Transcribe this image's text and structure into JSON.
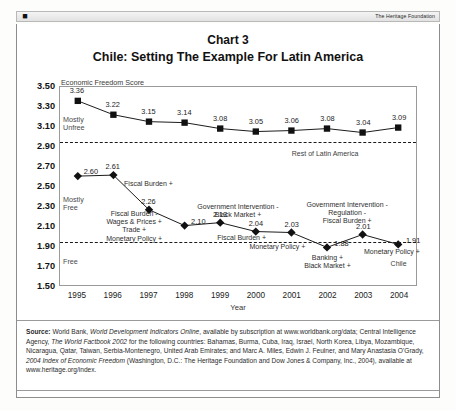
{
  "header": {
    "logo_icon": "heritage-mark-icon",
    "publisher": "The Heritage Foundation"
  },
  "titles": {
    "chart_label": "Chart 3",
    "chart_title": "Chile: Setting The Example For Latin America"
  },
  "chart_data": {
    "type": "line",
    "title": "Chile: Setting The Example For Latin America",
    "subtitle": "Chart 3",
    "axis_caption": "Economic Freedom Score",
    "xlabel": "Year",
    "ylabel": "Economic Freedom Score",
    "categories": [
      "1995",
      "1996",
      "1997",
      "1998",
      "1999",
      "2000",
      "2001",
      "2002",
      "2003",
      "2004"
    ],
    "ylim": [
      1.5,
      3.5
    ],
    "yticks": [
      "3.50",
      "3.30",
      "3.10",
      "2.90",
      "2.70",
      "2.50",
      "2.30",
      "2.10",
      "1.90",
      "1.70",
      "1.50"
    ],
    "grid": false,
    "legend": "none",
    "series": [
      {
        "name": "Rest of Latin America",
        "marker": "square",
        "values": [
          3.36,
          3.22,
          3.15,
          3.14,
          3.08,
          3.05,
          3.06,
          3.08,
          3.04,
          3.09
        ]
      },
      {
        "name": "Chile",
        "marker": "diamond",
        "values": [
          2.6,
          2.61,
          2.26,
          2.1,
          2.13,
          2.04,
          2.03,
          1.88,
          2.01,
          1.91
        ]
      }
    ],
    "reference_lines": [
      {
        "label": "Mostly Unfree / upper band",
        "value": 2.95
      },
      {
        "label": "Mostly Free / lower band",
        "value": 1.95
      }
    ],
    "zone_labels": [
      {
        "text": "Mostly\nUnfree",
        "value": 3.14
      },
      {
        "text": "Mostly\nFree",
        "value": 2.34
      },
      {
        "text": "Free",
        "value": 1.72
      }
    ],
    "series_labels": [
      {
        "text": "Rest of Latin America",
        "x": 2002,
        "value": 2.86
      },
      {
        "text": "Chile",
        "x": 2004,
        "value": 1.76
      }
    ],
    "annotations": [
      {
        "text": "Fiscal Burden +",
        "x": 1997,
        "value": 2.56
      },
      {
        "text": "Fiscal Burden -\nWages & Prices +\nTrade +\nMonetary Policy +",
        "x": 1996.6,
        "value": 2.26
      },
      {
        "text": "Government Intervention -\nBlack Market +",
        "x": 1999.5,
        "value": 2.33
      },
      {
        "text": "Fiscal Burden +",
        "x": 1999.6,
        "value": 2.02
      },
      {
        "text": "Monetary Policy +",
        "x": 2000.6,
        "value": 1.93
      },
      {
        "text": "Banking +\nBlack Market +",
        "x": 2002,
        "value": 1.82
      },
      {
        "text": "Government Intervention -\nRegulation -\nFiscal Burden +",
        "x": 2002.55,
        "value": 2.35
      },
      {
        "text": "Monetary Policy +",
        "x": 2003.8,
        "value": 1.88
      }
    ]
  },
  "source": {
    "label": "Source:",
    "line1_a": " World Bank, ",
    "line1_i": "World Development Indicators Online",
    "line1_b": ", available by subscription at www.worldbank.org/data; Central Intelligence Agency, ",
    "line2_i": "The World Factbook 2002",
    "line2_b": " for the following countries: Bahamas, Burma, Cuba, Iraq, Israel, North Korea, Libya, Mozambique, Nicaragua, Qatar, Taiwan, Serbia-Montenegro, United Arab Emirates; and Marc A. Miles, Edwin J. Feulner, and Mary Anastasia O'Grady, ",
    "line3_i": "2004 Index of Economic Freedom",
    "line3_b": " (Washington, D.C.: The Heritage Foundation and Dow Jones & Company, Inc., 2004), available at www.heritage.org/index."
  }
}
